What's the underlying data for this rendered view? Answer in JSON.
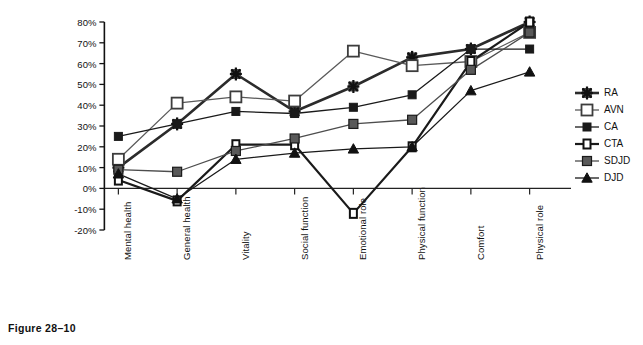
{
  "figure": {
    "caption": "Figure 28–10"
  },
  "chart_data": {
    "type": "line",
    "title": "",
    "xlabel": "",
    "ylabel": "Deficit (% below age/sex-matched controls)",
    "ylim": [
      -20,
      80
    ],
    "yticks": [
      -20,
      -10,
      0,
      10,
      20,
      30,
      40,
      50,
      60,
      70,
      80
    ],
    "ytick_labels": [
      "-20%",
      "-10%",
      "0%",
      "10%",
      "20%",
      "30%",
      "40%",
      "50%",
      "60%",
      "70%",
      "80%"
    ],
    "grid": false,
    "legend_position": "right",
    "categories": [
      "Mental health",
      "General health",
      "Vitality",
      "Social function",
      "Emotional role",
      "Physical function",
      "Comfort",
      "Physical role"
    ],
    "series": [
      {
        "name": "RA",
        "marker": "star",
        "color": "#2b2b2b",
        "line_width": 2.6,
        "values": [
          10,
          31,
          55,
          37,
          49,
          63,
          67,
          80
        ]
      },
      {
        "name": "AVN",
        "marker": "open-square",
        "color": "#5a5a5a",
        "line_width": 1.3,
        "values": [
          14,
          41,
          44,
          42,
          66,
          59,
          61,
          75
        ]
      },
      {
        "name": "CA",
        "marker": "filled-square",
        "color": "#1a1a1a",
        "line_width": 1.3,
        "values": [
          25,
          31,
          37,
          36,
          39,
          45,
          67,
          67
        ]
      },
      {
        "name": "CTA",
        "marker": "open-square-small",
        "color": "#1a1a1a",
        "line_width": 2.2,
        "values": [
          4,
          -6,
          21,
          21,
          -12,
          20,
          61,
          80
        ]
      },
      {
        "name": "SDJD",
        "marker": "grey-square",
        "color": "#4d4d4d",
        "line_width": 1.3,
        "values": [
          9,
          8,
          18,
          24,
          31,
          33,
          57,
          75
        ]
      },
      {
        "name": "DJD",
        "marker": "triangle",
        "color": "#1a1a1a",
        "line_width": 1.3,
        "values": [
          7,
          -5,
          14,
          17,
          19,
          20,
          47,
          56
        ]
      }
    ]
  },
  "legend": {
    "entries": [
      {
        "label": "RA"
      },
      {
        "label": "AVN"
      },
      {
        "label": "CA"
      },
      {
        "label": "CTA"
      },
      {
        "label": "SDJD"
      },
      {
        "label": "DJD"
      }
    ]
  }
}
